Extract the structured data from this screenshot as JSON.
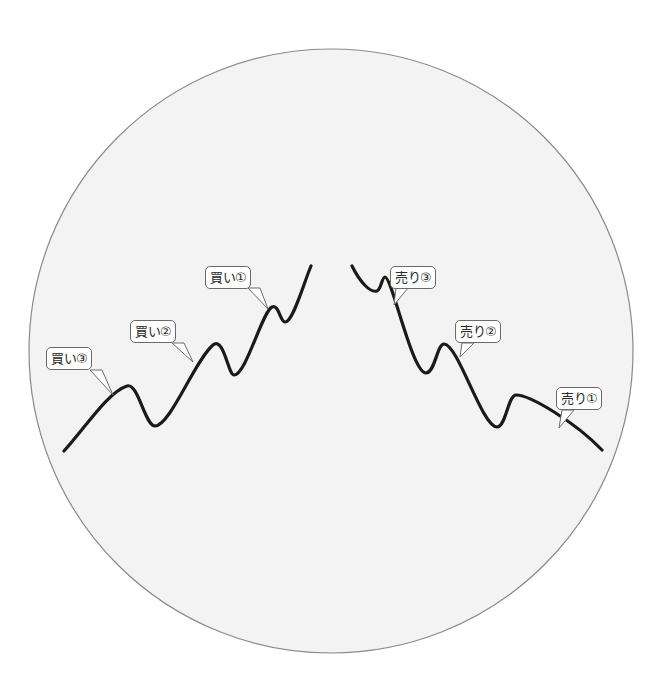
{
  "diagram": {
    "type": "price-trend-entry-points",
    "circle": {
      "cx": 331,
      "cy": 351,
      "r": 302,
      "fill": "#f3f3f3",
      "stroke": "#8a8a8a"
    },
    "line_color": "#1a1a1a",
    "uptrend": {
      "label": "buy",
      "path": [
        [
          64,
          451
        ],
        [
          127,
          386
        ],
        [
          155,
          426
        ],
        [
          213,
          345
        ],
        [
          234,
          375
        ],
        [
          272,
          307
        ],
        [
          285,
          322
        ],
        [
          311,
          266
        ]
      ],
      "callouts": [
        {
          "id": "buy-1",
          "text": "買い①",
          "box": [
            205,
            266,
            60,
            23
          ],
          "tail": [
            268,
            309
          ]
        },
        {
          "id": "buy-2",
          "text": "買い②",
          "box": [
            130,
            320,
            60,
            23
          ],
          "tail": [
            193,
            362
          ]
        },
        {
          "id": "buy-3",
          "text": "買い③",
          "box": [
            46,
            347,
            60,
            23
          ],
          "tail": [
            113,
            395
          ]
        }
      ]
    },
    "downtrend": {
      "label": "sell",
      "path": [
        [
          352,
          266
        ],
        [
          377,
          291
        ],
        [
          385,
          277
        ],
        [
          426,
          373
        ],
        [
          444,
          344
        ],
        [
          497,
          427
        ],
        [
          516,
          395
        ],
        [
          602,
          450
        ]
      ],
      "callouts": [
        {
          "id": "sell-3",
          "text": "売り③",
          "box": [
            390,
            266,
            60,
            23
          ],
          "tail": [
            394,
            305
          ]
        },
        {
          "id": "sell-2",
          "text": "売り②",
          "box": [
            455,
            320,
            60,
            23
          ],
          "tail": [
            460,
            357
          ]
        },
        {
          "id": "sell-1",
          "text": "売り①",
          "box": [
            556,
            387,
            60,
            23
          ],
          "tail": [
            559,
            428
          ]
        }
      ]
    }
  },
  "labels": {
    "buy_1": "買い①",
    "buy_2": "買い②",
    "buy_3": "買い③",
    "sell_1": "売り①",
    "sell_2": "売り②",
    "sell_3": "売り③"
  }
}
